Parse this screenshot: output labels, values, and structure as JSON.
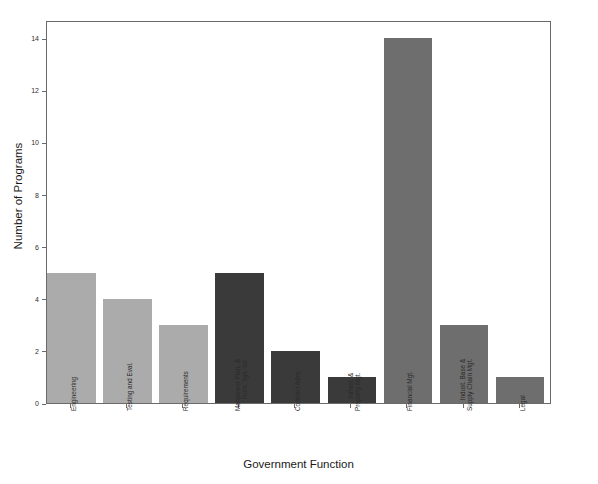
{
  "chart_data": {
    "type": "bar",
    "title": "",
    "subtitle": "",
    "xlabel": "Government Function",
    "ylabel": "Number of Programs",
    "categories": [
      "Engineering",
      "Testing and Eval.",
      "Requirements",
      "Manpower Plan. & Hum. Sys. Int.",
      "Contract Adm.",
      "Infrast. & Property Mgt.",
      "Financial Mgt.",
      "Indust. Base & Supply Chain Mgt.",
      "Legal"
    ],
    "category_label_lines": [
      [
        "Engineering"
      ],
      [
        "Testing and Eval."
      ],
      [
        "Requirements"
      ],
      [
        "Manpower Plan. &",
        "Hum. Sys. Int."
      ],
      [
        "Contract Adm."
      ],
      [
        "Infrast. &",
        "Property Mgt."
      ],
      [
        "Financial Mgt."
      ],
      [
        "Indust. Base &",
        "Supply Chain Mgt."
      ],
      [
        "Legal"
      ]
    ],
    "values": [
      5,
      4,
      3,
      5,
      2,
      1,
      14,
      3,
      1
    ],
    "bar_colors": [
      "#ABABAB",
      "#ABABAB",
      "#ABABAB",
      "#3A3A3A",
      "#3A3A3A",
      "#3A3A3A",
      "#6E6E6E",
      "#6E6E6E",
      "#6E6E6E"
    ],
    "ylim": [
      0,
      14.7
    ],
    "ytick_values": [
      0,
      2,
      4,
      6,
      8,
      10,
      12,
      14
    ],
    "ytick_labels": [
      "0",
      "2",
      "4",
      "6",
      "8",
      "10",
      "12",
      "14"
    ],
    "grid": false,
    "legend": false,
    "legend_position": "none",
    "background_color": "#FFFFFF",
    "frame_color": "#6A6A6A"
  }
}
